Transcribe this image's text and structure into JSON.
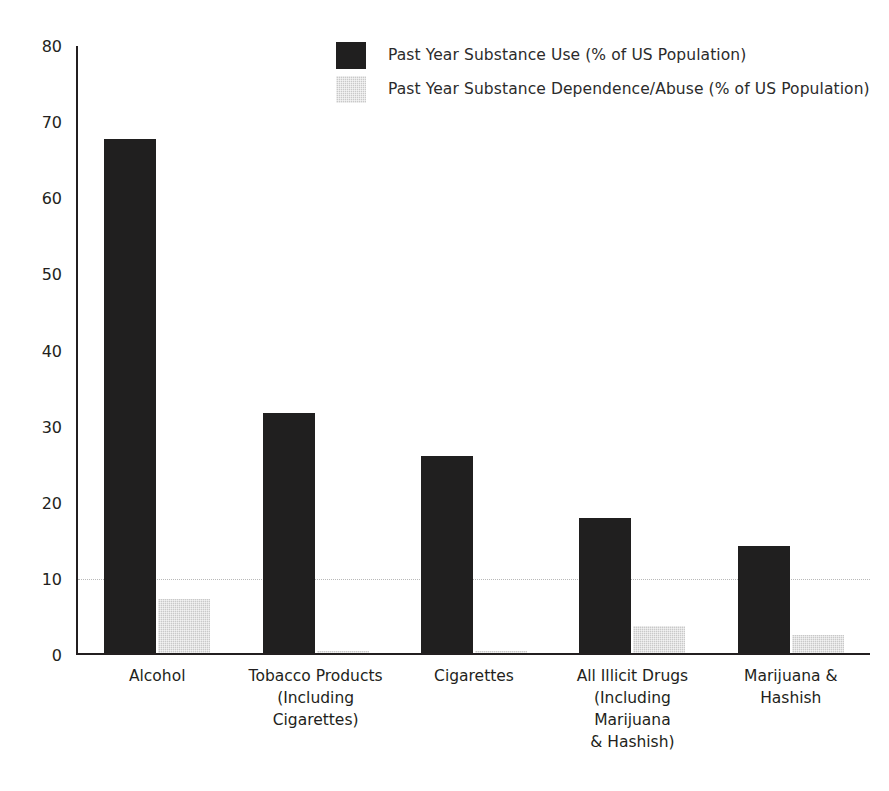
{
  "chart_data": {
    "type": "bar",
    "title": "",
    "subtitle": "",
    "xlabel": "",
    "ylabel": "",
    "ylim": [
      0,
      80
    ],
    "yticks": [
      0,
      10,
      20,
      30,
      40,
      50,
      60,
      70,
      80
    ],
    "ytick_labels": [
      "0",
      "10",
      "20",
      "30",
      "40",
      "50",
      "60",
      "70",
      "80"
    ],
    "grid": "horizontal dotted gridline at 10 only",
    "legend_position": "top-center",
    "categories": [
      "Alcohol",
      "Tobacco Products (Including Cigarettes)",
      "Cigarettes",
      "All Illicit Drugs (Including Marijuana & Hashish)",
      "Marijuana & Hashish"
    ],
    "category_lines": [
      [
        "Alcohol"
      ],
      [
        "Tobacco Products",
        "(Including Cigarettes)"
      ],
      [
        "Cigarettes"
      ],
      [
        "All Illicit Drugs",
        "(Including Marijuana",
        "& Hashish)"
      ],
      [
        "Marijuana & Hashish"
      ]
    ],
    "series": [
      {
        "name": "Past Year Substance Use (% of US Population)",
        "color": "#201f1f",
        "values": [
          67.5,
          31.5,
          25.9,
          17.8,
          14.1
        ]
      },
      {
        "name": "Past Year Substance Dependence/Abuse (% of US Population)",
        "color": "#c9c9c9",
        "values": [
          7.1,
          0.2,
          0.3,
          3.5,
          2.4
        ]
      }
    ]
  },
  "legend": {
    "items": [
      {
        "label": "Past Year Substance Use (% of US Population)",
        "swatch": "series-use"
      },
      {
        "label": "Past Year Substance Dependence/Abuse (% of US Population)",
        "swatch": "series-dep"
      }
    ]
  },
  "axis": {
    "y_max": 80,
    "y_min": 0,
    "gridline_value": 10
  },
  "colors": {
    "series_use": "#201f1f",
    "series_dependence": "#c9c9c9",
    "axis": "#231f20",
    "gridline": "#b9b9b9",
    "background": "#ffffff"
  }
}
